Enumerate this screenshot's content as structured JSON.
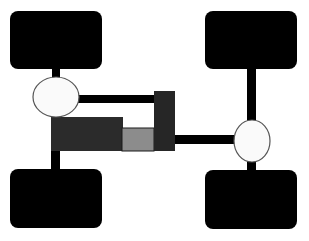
{
  "diagram": {
    "components": [
      {
        "id": "wheel-front-left",
        "type": "wheel"
      },
      {
        "id": "wheel-front-right",
        "type": "wheel"
      },
      {
        "id": "wheel-rear-left",
        "type": "wheel"
      },
      {
        "id": "wheel-rear-right",
        "type": "wheel"
      },
      {
        "id": "front-differential",
        "type": "differential"
      },
      {
        "id": "rear-differential",
        "type": "differential"
      },
      {
        "id": "engine",
        "type": "engine"
      },
      {
        "id": "transmission",
        "type": "gearbox"
      },
      {
        "id": "transfer-case",
        "type": "transfer-case"
      }
    ],
    "colors": {
      "wheel": "#000000",
      "shaft": "#000000",
      "differential_fill": "#fafafa",
      "differential_stroke": "#555555",
      "engine": "#2b2b2b",
      "transmission": "#8c8c8c",
      "transfer_case": "#262626",
      "background": "#ffffff"
    }
  }
}
